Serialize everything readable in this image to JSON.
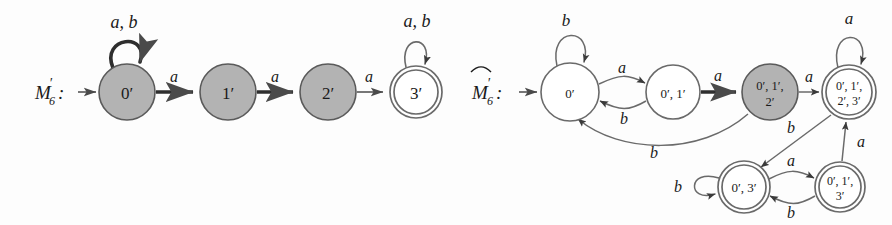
{
  "figure": {
    "width": 892,
    "height": 225,
    "background": "#fdfdfd",
    "stroke_color": "#4a4a4a",
    "text_color": "#1a1a1a",
    "accepting_fill": "#ffffff",
    "highlight_fill": "#b3b3b3"
  },
  "machines": [
    {
      "id": "m6-prime",
      "label": "M",
      "label_sub": "6",
      "label_prime": "′",
      "label_colon": ":",
      "has_hat": false,
      "states": [
        {
          "id": "s0",
          "label_line1": "0′",
          "label_line2": "",
          "cx": 127,
          "cy": 92,
          "r": 28,
          "fill": "highlight",
          "accepting": false,
          "start": true
        },
        {
          "id": "s1",
          "label_line1": "1′",
          "label_line2": "",
          "cx": 228,
          "cy": 92,
          "r": 28,
          "fill": "highlight",
          "accepting": false,
          "start": false
        },
        {
          "id": "s2",
          "label_line1": "2′",
          "label_line2": "",
          "cx": 328,
          "cy": 92,
          "r": 28,
          "fill": "highlight",
          "accepting": false,
          "start": false
        },
        {
          "id": "s3",
          "label_line1": "3′",
          "label_line2": "",
          "cx": 416,
          "cy": 92,
          "r": 26,
          "fill": "white",
          "accepting": true,
          "start": false
        }
      ],
      "transitions": [
        {
          "from": "s0",
          "to": "s0",
          "label": "a, b",
          "kind": "self-loop",
          "bold": false
        },
        {
          "from": "s0",
          "to": "s1",
          "label": "a",
          "kind": "straight",
          "bold": true
        },
        {
          "from": "s1",
          "to": "s2",
          "label": "a",
          "kind": "straight",
          "bold": true
        },
        {
          "from": "s2",
          "to": "s3",
          "label": "a",
          "kind": "straight",
          "bold": false
        },
        {
          "from": "s3",
          "to": "s3",
          "label": "a, b",
          "kind": "self-loop",
          "bold": false
        }
      ]
    },
    {
      "id": "m6-hat-prime",
      "label": "M",
      "label_sub": "6",
      "label_prime": "′",
      "label_colon": ":",
      "has_hat": true,
      "states": [
        {
          "id": "t0",
          "label_line1": "0′",
          "label_line2": "",
          "cx": 570,
          "cy": 92,
          "r": 29,
          "fill": "white",
          "accepting": false,
          "start": true
        },
        {
          "id": "t1",
          "label_line1": "0′, 1′",
          "label_line2": "",
          "cx": 673,
          "cy": 92,
          "r": 27,
          "fill": "white",
          "accepting": false,
          "start": false
        },
        {
          "id": "t2",
          "label_line1": "0′, 1′,",
          "label_line2": "2′",
          "cx": 770,
          "cy": 92,
          "r": 28,
          "fill": "highlight",
          "accepting": false,
          "start": false
        },
        {
          "id": "t3",
          "label_line1": "0′, 1′,",
          "label_line2": "2′, 3′",
          "cx": 849,
          "cy": 92,
          "r": 27,
          "fill": "white",
          "accepting": true,
          "start": false
        },
        {
          "id": "t4",
          "label_line1": "0′, 3′",
          "label_line2": "",
          "cx": 744,
          "cy": 187,
          "r": 26,
          "fill": "white",
          "accepting": true,
          "start": false
        },
        {
          "id": "t5",
          "label_line1": "0′, 1′,",
          "label_line2": "3′",
          "cx": 840,
          "cy": 187,
          "r": 25,
          "fill": "white",
          "accepting": true,
          "start": false
        }
      ],
      "transitions": [
        {
          "from": "t0",
          "to": "t0",
          "label": "b",
          "kind": "self-loop",
          "bold": false
        },
        {
          "from": "t0",
          "to": "t1",
          "label": "a",
          "kind": "curve-over",
          "bold": false
        },
        {
          "from": "t1",
          "to": "t0",
          "label": "b",
          "kind": "curve-under",
          "bold": false
        },
        {
          "from": "t1",
          "to": "t2",
          "label": "a",
          "kind": "straight",
          "bold": true
        },
        {
          "from": "t2",
          "to": "t0",
          "label": "b",
          "kind": "long-curve",
          "bold": false
        },
        {
          "from": "t2",
          "to": "t3",
          "label": "a",
          "kind": "straight",
          "bold": false
        },
        {
          "from": "t3",
          "to": "t3",
          "label": "a",
          "kind": "self-loop",
          "bold": false
        },
        {
          "from": "t3",
          "to": "t4",
          "label": "b",
          "kind": "diagonal",
          "bold": false
        },
        {
          "from": "t4",
          "to": "t4",
          "label": "b",
          "kind": "self-loop-left",
          "bold": false
        },
        {
          "from": "t4",
          "to": "t5",
          "label": "a",
          "kind": "curve-over",
          "bold": false
        },
        {
          "from": "t5",
          "to": "t4",
          "label": "b",
          "kind": "curve-under",
          "bold": false
        },
        {
          "from": "t5",
          "to": "t3",
          "label": "a",
          "kind": "vertical",
          "bold": false
        }
      ]
    }
  ],
  "left_machine": {
    "label_text": "M",
    "sub": "6",
    "prime": "′",
    "colon": ":",
    "state_0_label": "0′",
    "state_1_label": "1′",
    "state_2_label": "2′",
    "state_3_label": "3′",
    "loop_0_label": "a, b",
    "loop_3_label": "a, b",
    "edge_01_label": "a",
    "edge_12_label": "a",
    "edge_23_label": "a"
  },
  "right_machine": {
    "label_text": "M",
    "sub": "6",
    "prime": "′",
    "colon": ":",
    "state_t0_label": "0′",
    "state_t1_label": "0′, 1′",
    "state_t2_line1": "0′, 1′,",
    "state_t2_line2": "2′",
    "state_t3_line1": "0′, 1′,",
    "state_t3_line2": "2′, 3′",
    "state_t4_label": "0′, 3′",
    "state_t5_line1": "0′, 1′,",
    "state_t5_line2": "3′",
    "loop_t0_label": "b",
    "loop_t3_label": "a",
    "loop_t4_label": "b",
    "edge_t0_t1_label": "a",
    "edge_t1_t0_label": "b",
    "edge_t1_t2_label": "a",
    "edge_t2_t0_label": "b",
    "edge_t2_t3_label": "a",
    "edge_t3_t4_label": "b",
    "edge_t4_t5_label": "a",
    "edge_t5_t4_label": "b",
    "edge_t5_t3_label": "a"
  }
}
